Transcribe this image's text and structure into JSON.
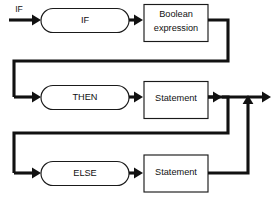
{
  "diagram": {
    "type": "railroad-syntax-diagram",
    "entry_label": "IF",
    "colors": {
      "background": "#ffffff",
      "line": "#111111",
      "node_stroke": "#1a1a1a",
      "node_fill": "#ffffff",
      "text": "#111111"
    },
    "rows": [
      {
        "id": "if-row",
        "terminal": {
          "label": "IF",
          "shape": "stadium"
        },
        "nonterminal": {
          "label_line1": "Boolean",
          "label_line2": "expression",
          "shape": "rect"
        }
      },
      {
        "id": "then-row",
        "terminal": {
          "label": "THEN",
          "shape": "stadium"
        },
        "nonterminal": {
          "label_line1": "Statement",
          "label_line2": "",
          "shape": "rect"
        }
      },
      {
        "id": "else-row",
        "terminal": {
          "label": "ELSE",
          "shape": "stadium"
        },
        "nonterminal": {
          "label_line1": "Statement",
          "label_line2": "",
          "shape": "rect"
        }
      }
    ],
    "icons": {
      "entry_arrow": "arrow-right-icon",
      "exit_arrow": "arrow-right-icon",
      "merge_arrow": "arrow-up-icon"
    }
  }
}
